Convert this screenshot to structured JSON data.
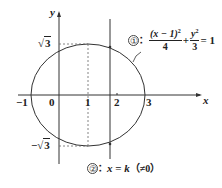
{
  "diagram": {
    "axes": {
      "x_label": "x",
      "y_label": "y",
      "x_ticks": [
        "−1",
        "0",
        "1",
        "2",
        "3"
      ],
      "y_ticks": {
        "top": "√3",
        "bottom": "−√3"
      },
      "tick_radical_top": "3",
      "tick_radical_bottom": "3",
      "minus": "−"
    },
    "curve1": {
      "marker": "①",
      "sep": "：",
      "num": "(x − 1)",
      "num_exp": "2",
      "den1": "4",
      "plus": "+",
      "y_var": "y",
      "y_exp": "2",
      "den2": "3",
      "rhs": "= 1",
      "description": "ellipse (x−1)²/4 + y²/3 = 1"
    },
    "line2": {
      "marker": "②",
      "sep": "：",
      "lhs": "x",
      "eq": " = ",
      "k": "k",
      "cond": "（≠0）",
      "description": "vertical line x = k (≠ 0)"
    },
    "colors": {
      "stroke": "#333333",
      "dashed": "#666666"
    }
  }
}
